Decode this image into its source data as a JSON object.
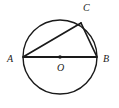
{
  "figure": {
    "kind": "circle-inscribed-triangle",
    "caption": "",
    "background_color": "#ffffff",
    "stroke_color": "#1a1a1a",
    "labels": {
      "a": "A",
      "b": "B",
      "c": "C",
      "o": "O"
    },
    "geometry": {
      "circle": {
        "cx": 60,
        "cy": 57,
        "r": 37,
        "stroke_width": 1.4
      },
      "center_dot": {
        "cx": 60,
        "cy": 57,
        "r": 1.8
      },
      "points": {
        "A": {
          "x": 23,
          "y": 57
        },
        "B": {
          "x": 97,
          "y": 57
        },
        "C": {
          "x": 81,
          "y": 23
        },
        "O": {
          "x": 60,
          "y": 57
        }
      },
      "segments": [
        {
          "name": "diameter-ab",
          "x1": 23,
          "y1": 57,
          "x2": 97,
          "y2": 57,
          "stroke_width": 2.2
        },
        {
          "name": "chord-ac",
          "x1": 23,
          "y1": 57,
          "x2": 81,
          "y2": 23,
          "stroke_width": 1.7
        },
        {
          "name": "chord-cb",
          "x1": 81,
          "y1": 23,
          "x2": 97,
          "y2": 57,
          "stroke_width": 1.7
        }
      ]
    }
  }
}
